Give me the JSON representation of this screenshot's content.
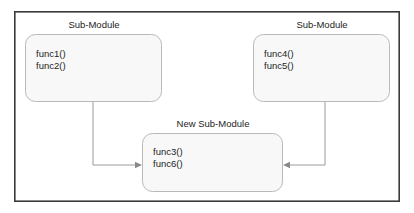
{
  "diagram": {
    "type": "module-decomposition-diagram",
    "frame": {
      "name": "diagram-frame",
      "x": 14,
      "y": 11,
      "width": 386,
      "height": 191,
      "border_color": "#3a3a3a",
      "background_color": "#ffffff"
    },
    "style": {
      "box_fill": "#f8f8f8",
      "box_border": "#b9b9b9",
      "connector_color": "#9a9a9a",
      "text_color": "#1d1d1d"
    },
    "modules": [
      {
        "id": "left-module",
        "caption": "Sub-Module",
        "caption_x": 94,
        "caption_y": 28,
        "box": {
          "x": 25,
          "y": 34,
          "width": 137,
          "height": 68,
          "radius": 10
        },
        "functions": [
          "func1()",
          "func2()"
        ],
        "text_x": 36,
        "text_y_start": 57,
        "text_line_height": 12
      },
      {
        "id": "right-module",
        "caption": "Sub-Module",
        "caption_x": 322,
        "caption_y": 28,
        "box": {
          "x": 253,
          "y": 34,
          "width": 137,
          "height": 68,
          "radius": 10
        },
        "functions": [
          "func4()",
          "func5()"
        ],
        "text_x": 264,
        "text_y_start": 57,
        "text_line_height": 12
      },
      {
        "id": "new-module",
        "caption": "New Sub-Module",
        "caption_x": 213,
        "caption_y": 127,
        "box": {
          "x": 142,
          "y": 133,
          "width": 141,
          "height": 59,
          "radius": 10
        },
        "functions": [
          "func3()",
          "func6()"
        ],
        "text_x": 153,
        "text_y_start": 155,
        "text_line_height": 12
      }
    ],
    "connectors": [
      {
        "id": "left-to-new",
        "from": "left-module",
        "to": "new-module",
        "path": "M 93 102 L 93 165 L 138 165",
        "arrow": {
          "x": 142,
          "y": 165,
          "direction": "right"
        }
      },
      {
        "id": "right-to-new",
        "from": "right-module",
        "to": "new-module",
        "path": "M 325 102 L 325 165 L 287 165",
        "arrow": {
          "x": 283,
          "y": 165,
          "direction": "left"
        }
      }
    ]
  }
}
